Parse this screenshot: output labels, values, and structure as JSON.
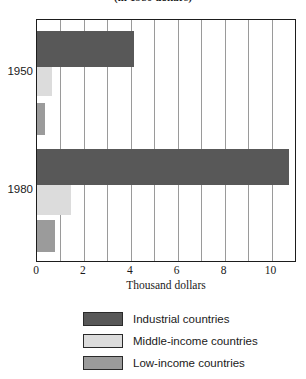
{
  "chart_data": {
    "type": "bar",
    "orientation": "horizontal",
    "title": "(in 1980 dollars)",
    "xlabel": "Thousand dollars",
    "ylabel": "",
    "categories": [
      "1950",
      "1980"
    ],
    "xticks": [
      "0",
      "2",
      "4",
      "6",
      "8",
      "10"
    ],
    "xtick_values": [
      0,
      2,
      4,
      6,
      8,
      10
    ],
    "xlim": [
      0,
      11
    ],
    "grid": "vertical gridlines at every 1 thousand dollars",
    "legend_position": "below-plot-center",
    "series": [
      {
        "name": "Industrial countries",
        "color": "#585858",
        "values": [
          4.15,
          10.75
        ]
      },
      {
        "name": "Middle-income countries",
        "color": "#dcdcdc",
        "values": [
          0.63,
          1.43
        ]
      },
      {
        "name": "Low-income countries",
        "color": "#9b9b9b",
        "values": [
          0.34,
          0.76
        ]
      }
    ]
  },
  "axis": {
    "x_title": "Thousand dollars",
    "ticks": [
      {
        "label": "0",
        "value": 0
      },
      {
        "label": "2",
        "value": 2
      },
      {
        "label": "4",
        "value": 4
      },
      {
        "label": "6",
        "value": 6
      },
      {
        "label": "8",
        "value": 8
      },
      {
        "label": "10",
        "value": 10
      }
    ]
  },
  "categories": [
    {
      "label": "1950"
    },
    {
      "label": "1980"
    }
  ],
  "legend": {
    "items": [
      {
        "label": "Industrial countries",
        "color": "#585858"
      },
      {
        "label": "Middle-income countries",
        "color": "#dcdcdc"
      },
      {
        "label": "Low-income countries",
        "color": "#9b9b9b"
      }
    ]
  },
  "colors": {
    "industrial": "#585858",
    "middle_income": "#dcdcdc",
    "low_income": "#9b9b9b",
    "frame": "#1d1d1d",
    "gridline": "#9a9a9a",
    "background": "#ffffff"
  }
}
